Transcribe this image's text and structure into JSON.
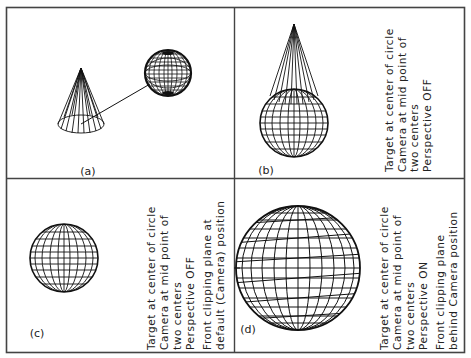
{
  "figure": {
    "border_color": "#444444",
    "line_color": "#111111",
    "background": "#ffffff"
  },
  "panels": {
    "a": {
      "label": "(a)",
      "caption": []
    },
    "b": {
      "label": "(b)",
      "caption": [
        "Target at center of circle",
        "Camera at mid point of",
        "two centers",
        "Perspective OFF"
      ]
    },
    "c": {
      "label": "(c)",
      "caption": [
        "Target at center of circle",
        "Camera at mid point of",
        "two centers",
        "Perspective OFF",
        "Front clipping plane at",
        "default (Camera) position"
      ]
    },
    "d": {
      "label": "(d)",
      "caption": [
        "Target at center of circle",
        "Camera at mid point of",
        "two centers",
        "Perspective ON",
        "Front clipping plane",
        "behind Camera position"
      ]
    }
  }
}
